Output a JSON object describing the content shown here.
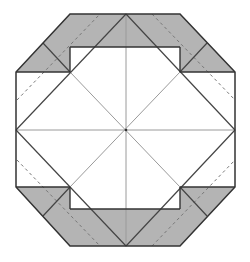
{
  "diagram": {
    "type": "origami-crease-pattern",
    "shape": "octagon",
    "colors": {
      "background": "#ffffff",
      "shaded_fill": "#b4b4b4",
      "outline": "#333333",
      "crease_light": "#9a9a9a",
      "crease_dark": "#444444",
      "dashed": "#777777"
    },
    "outline_points": [
      [
        70,
        14
      ],
      [
        180,
        14
      ],
      [
        235,
        72
      ],
      [
        235,
        187
      ],
      [
        180,
        246
      ],
      [
        70,
        246
      ],
      [
        16,
        187
      ],
      [
        16,
        72
      ]
    ],
    "shaded_regions": [
      {
        "name": "top-band",
        "points": [
          [
            70,
            14
          ],
          [
            180,
            14
          ],
          [
            180,
            47
          ],
          [
            70,
            47
          ]
        ]
      },
      {
        "name": "bottom-band",
        "points": [
          [
            70,
            209
          ],
          [
            180,
            209
          ],
          [
            180,
            246
          ],
          [
            70,
            246
          ]
        ]
      },
      {
        "name": "top-left-corner",
        "points": [
          [
            70,
            14
          ],
          [
            70,
            72
          ],
          [
            16,
            72
          ]
        ]
      },
      {
        "name": "top-right-corner",
        "points": [
          [
            180,
            14
          ],
          [
            235,
            72
          ],
          [
            180,
            72
          ]
        ]
      },
      {
        "name": "bottom-left-corner",
        "points": [
          [
            16,
            187
          ],
          [
            70,
            187
          ],
          [
            70,
            246
          ]
        ]
      },
      {
        "name": "bottom-right-corner",
        "points": [
          [
            180,
            187
          ],
          [
            235,
            187
          ],
          [
            180,
            246
          ]
        ]
      }
    ],
    "inner_rect_lines": [
      [
        [
          70,
          47
        ],
        [
          70,
          72
        ]
      ],
      [
        [
          180,
          47
        ],
        [
          180,
          72
        ]
      ],
      [
        [
          70,
          187
        ],
        [
          70,
          209
        ]
      ],
      [
        [
          180,
          187
        ],
        [
          180,
          209
        ]
      ],
      [
        [
          70,
          47
        ],
        [
          180,
          47
        ]
      ],
      [
        [
          70,
          209
        ],
        [
          180,
          209
        ]
      ],
      [
        [
          16,
          72
        ],
        [
          70,
          72
        ]
      ],
      [
        [
          180,
          72
        ],
        [
          235,
          72
        ]
      ],
      [
        [
          16,
          187
        ],
        [
          70,
          187
        ]
      ],
      [
        [
          180,
          187
        ],
        [
          235,
          187
        ]
      ]
    ],
    "light_creases": [
      [
        [
          126,
          14
        ],
        [
          126,
          246
        ]
      ],
      [
        [
          16,
          130
        ],
        [
          235,
          130
        ]
      ],
      [
        [
          70,
          72
        ],
        [
          180,
          187
        ]
      ],
      [
        [
          180,
          72
        ],
        [
          70,
          187
        ]
      ]
    ],
    "dark_creases": [
      [
        [
          16,
          130
        ],
        [
          126,
          14
        ]
      ],
      [
        [
          126,
          14
        ],
        [
          235,
          130
        ]
      ],
      [
        [
          235,
          130
        ],
        [
          126,
          246
        ]
      ],
      [
        [
          126,
          246
        ],
        [
          16,
          130
        ]
      ],
      [
        [
          43,
          43
        ],
        [
          70,
          72
        ]
      ],
      [
        [
          207,
          43
        ],
        [
          180,
          72
        ]
      ],
      [
        [
          43,
          216
        ],
        [
          70,
          187
        ]
      ],
      [
        [
          207,
          216
        ],
        [
          180,
          187
        ]
      ]
    ],
    "dashed_creases": [
      [
        [
          17,
          100
        ],
        [
          100,
          14
        ]
      ],
      [
        [
          152,
          14
        ],
        [
          235,
          100
        ]
      ],
      [
        [
          17,
          160
        ],
        [
          100,
          246
        ]
      ],
      [
        [
          152,
          246
        ],
        [
          235,
          160
        ]
      ]
    ]
  }
}
